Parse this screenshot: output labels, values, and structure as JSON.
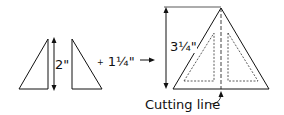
{
  "diagram": {
    "left_height_label": "2\"",
    "seam_label": "+ 1¼\"",
    "seam_prefix": "+",
    "seam_value": "1¼\"",
    "result_height_label": "3¼\"",
    "cutting_line_label": "Cutting line",
    "colors": {
      "stroke": "#111111",
      "background": "#ffffff"
    }
  }
}
